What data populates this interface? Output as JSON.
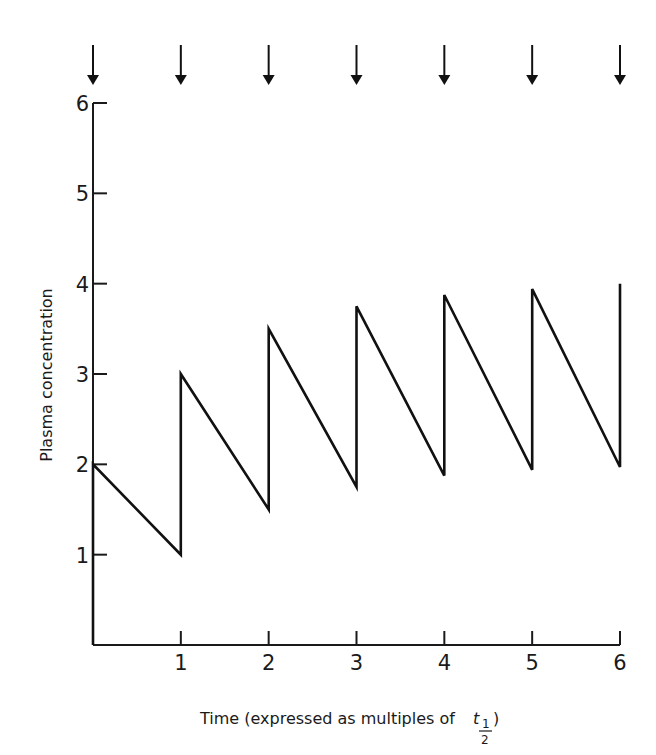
{
  "chart_data": {
    "type": "line",
    "title": "",
    "xlabel": "Time (expressed as multiples of t½)",
    "xlabel_main": "Time (expressed as multiples of ",
    "xlabel_symbol": "t",
    "xlabel_sub_num": "1",
    "xlabel_sub_den": "2",
    "xlabel_close": ")",
    "ylabel": "Plasma concentration",
    "xlim": [
      0,
      6
    ],
    "ylim": [
      0,
      6
    ],
    "x_ticks": [
      1,
      2,
      3,
      4,
      5,
      6
    ],
    "y_ticks": [
      1,
      2,
      3,
      4,
      5,
      6
    ],
    "grid": false,
    "legend": null,
    "annotations": [
      {
        "type": "dose-arrow",
        "x": 0
      },
      {
        "type": "dose-arrow",
        "x": 1
      },
      {
        "type": "dose-arrow",
        "x": 2
      },
      {
        "type": "dose-arrow",
        "x": 3
      },
      {
        "type": "dose-arrow",
        "x": 4
      },
      {
        "type": "dose-arrow",
        "x": 5
      },
      {
        "type": "dose-arrow",
        "x": 6
      }
    ],
    "series": [
      {
        "name": "Plasma concentration (repeated dosing every half-life)",
        "points": [
          [
            0,
            0
          ],
          [
            0,
            2.0
          ],
          [
            1,
            1.0
          ],
          [
            1,
            3.0
          ],
          [
            2,
            1.5
          ],
          [
            2,
            3.5
          ],
          [
            3,
            1.75
          ],
          [
            3,
            3.75
          ],
          [
            4,
            1.875
          ],
          [
            4,
            3.875
          ],
          [
            5,
            1.94
          ],
          [
            5,
            3.94
          ],
          [
            6,
            1.97
          ],
          [
            6,
            4.0
          ]
        ]
      }
    ],
    "peaks": [
      2.0,
      3.0,
      3.5,
      3.75,
      3.875,
      3.94,
      4.0
    ],
    "troughs": [
      1.0,
      1.5,
      1.75,
      1.875,
      1.94,
      1.97
    ]
  }
}
